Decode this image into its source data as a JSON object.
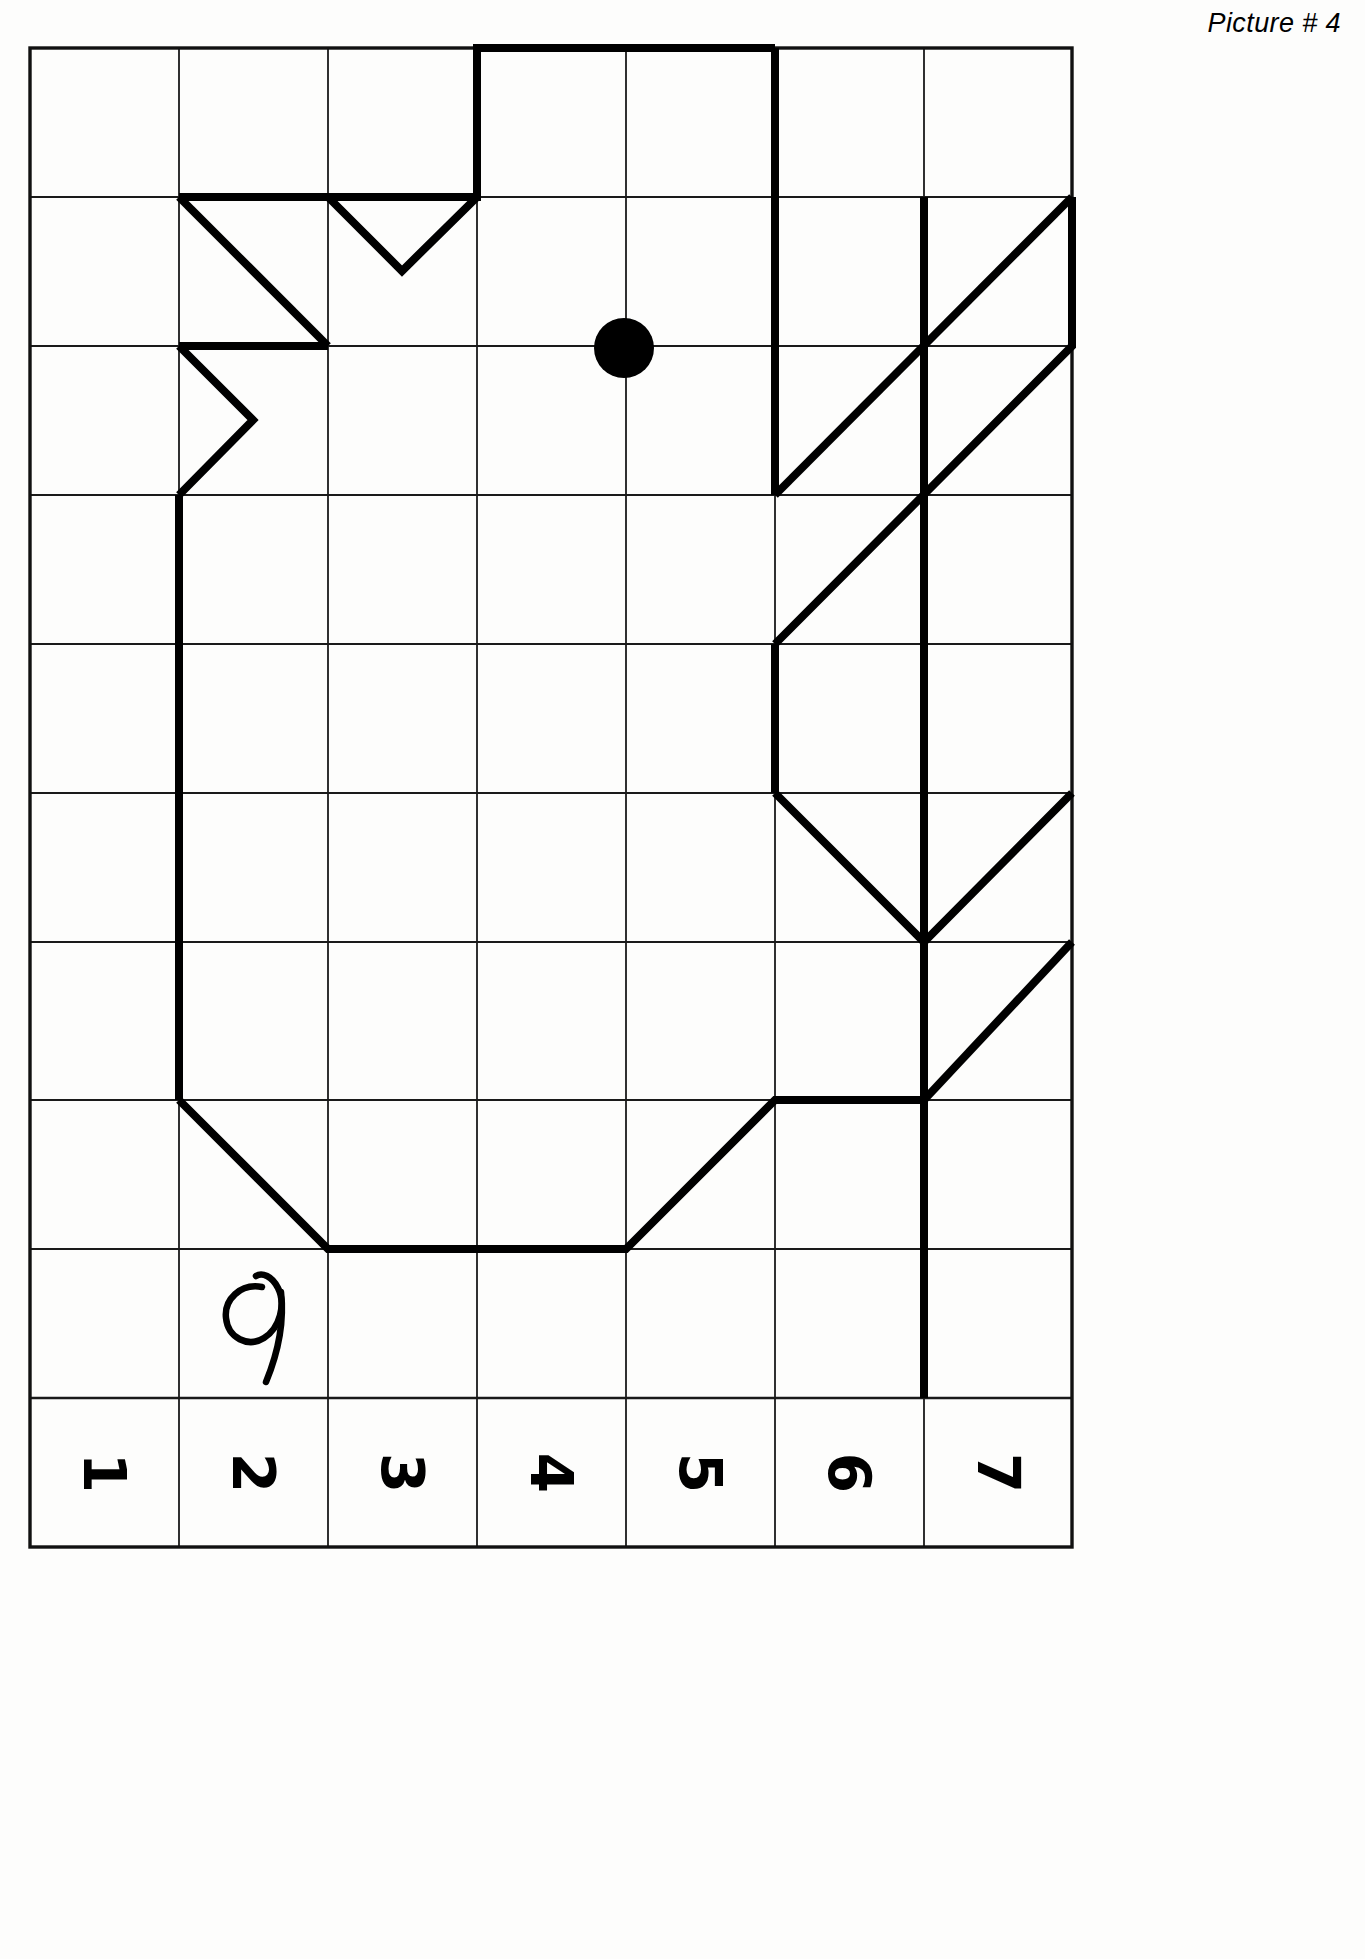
{
  "page": {
    "title": "Picture # 4",
    "background_color": "#fdfdfc",
    "ink_color": "#000000",
    "grid_line_color": "#1a1a1a",
    "width": 1365,
    "height": 1959
  },
  "grid": {
    "columns": 7,
    "rows": 10,
    "origin_x": 30,
    "origin_y": 48,
    "cell_width": 149,
    "cell_height": 149,
    "border_width": 3,
    "inner_line_width": 1.6
  },
  "column_labels": {
    "orientation": "rotated-90",
    "values": [
      "1",
      "2",
      "3",
      "4",
      "5",
      "6",
      "7"
    ]
  },
  "figure": {
    "name": "bird-outline",
    "stroke_width": 8,
    "stroke_color": "#000000",
    "paths": [
      "M 477 48 L 477 197 L 328 197 L 328 346 L 179 346 L 179 495 L 179 1100 L 328 1249 L 626 1249 L 775 1100 L 924 1100",
      "M 477 197 L 328 197 L 328 346 L 179 346",
      "M 179 197 L 328 346",
      "M 179 346 L 253 420 L 179 495"
    ],
    "polyline_points": [
      [
        477,
        48
      ],
      [
        775,
        48
      ],
      [
        775,
        495
      ],
      [
        924,
        346
      ],
      [
        1072,
        197
      ],
      [
        1072,
        346
      ],
      [
        924,
        495
      ],
      [
        924,
        1100
      ],
      [
        775,
        1100
      ],
      [
        626,
        1249
      ],
      [
        328,
        1249
      ],
      [
        179,
        1100
      ],
      [
        179,
        495
      ],
      [
        253,
        420
      ],
      [
        179,
        346
      ],
      [
        328,
        346
      ],
      [
        179,
        197
      ],
      [
        328,
        197
      ],
      [
        402,
        271
      ],
      [
        477,
        197
      ]
    ],
    "extra_segments": [
      {
        "name": "right-chevron-upper",
        "points": [
          [
            775,
            495
          ],
          [
            924,
            346
          ],
          [
            1072,
            197
          ],
          [
            1072,
            346
          ],
          [
            924,
            495
          ],
          [
            775,
            644
          ]
        ]
      },
      {
        "name": "right-chevron-lower",
        "points": [
          [
            775,
            793
          ],
          [
            924,
            942
          ],
          [
            1072,
            793
          ]
        ]
      },
      {
        "name": "right-tail-diagonal",
        "points": [
          [
            1072,
            942
          ],
          [
            924,
            1100
          ]
        ]
      },
      {
        "name": "right-spine",
        "points": [
          [
            924,
            197
          ],
          [
            924,
            1398
          ]
        ]
      }
    ],
    "eye": {
      "cx": 624,
      "cy": 348,
      "r": 30,
      "fill": "#000000"
    },
    "handwritten_mark": {
      "glyph": "9",
      "x": 258,
      "y": 1320
    }
  }
}
